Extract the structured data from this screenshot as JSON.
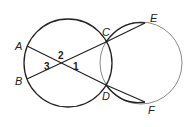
{
  "diagram": {
    "type": "geometry",
    "points": [
      {
        "id": "A",
        "label": "A",
        "x": 27,
        "y": 46,
        "lx": 15,
        "ly": 50
      },
      {
        "id": "B",
        "label": "B",
        "x": 27,
        "y": 79,
        "lx": 15,
        "ly": 85
      },
      {
        "id": "C",
        "label": "C",
        "x": 106,
        "y": 42,
        "lx": 102,
        "ly": 36
      },
      {
        "id": "D",
        "label": "D",
        "x": 106,
        "y": 85,
        "lx": 102,
        "ly": 100
      },
      {
        "id": "E",
        "label": "E",
        "x": 145,
        "y": 23,
        "lx": 150,
        "ly": 22
      },
      {
        "id": "F",
        "label": "F",
        "x": 145,
        "y": 102,
        "lx": 148,
        "ly": 114
      }
    ],
    "angles": [
      {
        "id": "1",
        "label": "1",
        "x": 73,
        "y": 70
      },
      {
        "id": "2",
        "label": "2",
        "x": 58,
        "y": 59
      },
      {
        "id": "3",
        "label": "3",
        "x": 44,
        "y": 70
      }
    ],
    "circles": [
      {
        "id": "left-circle",
        "cx": 68,
        "cy": 63,
        "r": 44
      },
      {
        "id": "right-circle",
        "cx": 141,
        "cy": 63,
        "r": 41
      }
    ],
    "segments": [
      "AD",
      "BC",
      "CE",
      "DF"
    ],
    "arcs": [
      "CE",
      "DF"
    ]
  }
}
